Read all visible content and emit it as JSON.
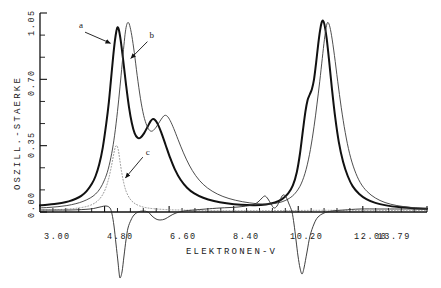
{
  "chart_data": {
    "type": "line",
    "title": "",
    "xlabel": "ELEKTRONEN-V",
    "ylabel": "OSZILL.-STAERKE",
    "xlim": [
      3.0,
      13.79
    ],
    "ylim": [
      0.0,
      1.05
    ],
    "grid": false,
    "legend_position": "inline-annotations",
    "xticklabels": [
      "3.00",
      "4.80",
      "6.60",
      "8.40",
      "10.20",
      "12.00",
      "13.79"
    ],
    "xtickvalues": [
      3.0,
      4.8,
      6.6,
      8.4,
      10.2,
      12.0,
      13.79
    ],
    "xminorticks": 5,
    "yticklabels": [
      "0.00",
      "0.35",
      "0.70",
      "1.05"
    ],
    "ytickvalues": [
      0.0,
      0.35,
      0.7,
      1.05
    ],
    "yminorticks": 2,
    "annotations": [
      {
        "label": "a",
        "x": 4.2,
        "y": 0.97,
        "target_x": 5.02,
        "target_y": 0.88
      },
      {
        "label": "b",
        "x": 6.05,
        "y": 0.92,
        "target_x": 5.42,
        "target_y": 0.8
      },
      {
        "label": "c",
        "x": 5.95,
        "y": 0.3,
        "target_x": 5.3,
        "target_y": 0.17
      }
    ],
    "series": [
      {
        "name": "a",
        "style": "thick-solid",
        "color": "#111111",
        "width": 2.0,
        "description": "main absorption spectrum, thick black curve",
        "points": [
          [
            3.0,
            0.035
          ],
          [
            3.2,
            0.038
          ],
          [
            3.4,
            0.042
          ],
          [
            3.6,
            0.048
          ],
          [
            3.8,
            0.056
          ],
          [
            4.0,
            0.07
          ],
          [
            4.15,
            0.085
          ],
          [
            4.3,
            0.11
          ],
          [
            4.45,
            0.15
          ],
          [
            4.55,
            0.19
          ],
          [
            4.65,
            0.25
          ],
          [
            4.75,
            0.34
          ],
          [
            4.85,
            0.47
          ],
          [
            4.92,
            0.58
          ],
          [
            4.98,
            0.7
          ],
          [
            5.04,
            0.82
          ],
          [
            5.09,
            0.905
          ],
          [
            5.13,
            0.955
          ],
          [
            5.16,
            0.975
          ],
          [
            5.2,
            0.96
          ],
          [
            5.25,
            0.905
          ],
          [
            5.32,
            0.8
          ],
          [
            5.4,
            0.67
          ],
          [
            5.48,
            0.555
          ],
          [
            5.56,
            0.47
          ],
          [
            5.64,
            0.415
          ],
          [
            5.72,
            0.392
          ],
          [
            5.8,
            0.392
          ],
          [
            5.9,
            0.415
          ],
          [
            6.0,
            0.45
          ],
          [
            6.08,
            0.478
          ],
          [
            6.14,
            0.49
          ],
          [
            6.2,
            0.487
          ],
          [
            6.28,
            0.465
          ],
          [
            6.38,
            0.42
          ],
          [
            6.5,
            0.355
          ],
          [
            6.62,
            0.29
          ],
          [
            6.76,
            0.225
          ],
          [
            6.92,
            0.17
          ],
          [
            7.1,
            0.128
          ],
          [
            7.3,
            0.098
          ],
          [
            7.55,
            0.075
          ],
          [
            7.85,
            0.058
          ],
          [
            8.2,
            0.046
          ],
          [
            8.6,
            0.038
          ],
          [
            9.0,
            0.036
          ],
          [
            9.3,
            0.04
          ],
          [
            9.55,
            0.05
          ],
          [
            9.75,
            0.068
          ],
          [
            9.92,
            0.098
          ],
          [
            10.05,
            0.14
          ],
          [
            10.16,
            0.21
          ],
          [
            10.25,
            0.31
          ],
          [
            10.33,
            0.43
          ],
          [
            10.4,
            0.53
          ],
          [
            10.46,
            0.59
          ],
          [
            10.52,
            0.62
          ],
          [
            10.58,
            0.648
          ],
          [
            10.64,
            0.7
          ],
          [
            10.7,
            0.79
          ],
          [
            10.76,
            0.89
          ],
          [
            10.81,
            0.96
          ],
          [
            10.85,
            0.998
          ],
          [
            10.89,
            1.01
          ],
          [
            10.93,
            0.99
          ],
          [
            10.99,
            0.92
          ],
          [
            11.06,
            0.8
          ],
          [
            11.14,
            0.65
          ],
          [
            11.23,
            0.5
          ],
          [
            11.33,
            0.37
          ],
          [
            11.45,
            0.265
          ],
          [
            11.58,
            0.19
          ],
          [
            11.72,
            0.135
          ],
          [
            11.9,
            0.095
          ],
          [
            12.1,
            0.068
          ],
          [
            12.35,
            0.048
          ],
          [
            12.65,
            0.035
          ],
          [
            13.0,
            0.026
          ],
          [
            13.4,
            0.02
          ],
          [
            13.79,
            0.017
          ]
        ]
      },
      {
        "name": "b",
        "style": "thin-solid",
        "color": "#3a3a3a",
        "width": 0.9,
        "description": "comparison spectrum, thin curve shifted slightly to higher energy",
        "points": [
          [
            3.0,
            0.022
          ],
          [
            3.25,
            0.024
          ],
          [
            3.5,
            0.028
          ],
          [
            3.75,
            0.034
          ],
          [
            4.0,
            0.044
          ],
          [
            4.2,
            0.056
          ],
          [
            4.4,
            0.074
          ],
          [
            4.55,
            0.095
          ],
          [
            4.68,
            0.125
          ],
          [
            4.8,
            0.17
          ],
          [
            4.9,
            0.225
          ],
          [
            5.0,
            0.31
          ],
          [
            5.08,
            0.405
          ],
          [
            5.16,
            0.53
          ],
          [
            5.23,
            0.66
          ],
          [
            5.29,
            0.78
          ],
          [
            5.34,
            0.88
          ],
          [
            5.38,
            0.95
          ],
          [
            5.42,
            0.99
          ],
          [
            5.46,
            1.0
          ],
          [
            5.5,
            0.985
          ],
          [
            5.56,
            0.93
          ],
          [
            5.63,
            0.84
          ],
          [
            5.71,
            0.72
          ],
          [
            5.8,
            0.6
          ],
          [
            5.89,
            0.51
          ],
          [
            5.98,
            0.455
          ],
          [
            6.06,
            0.43
          ],
          [
            6.14,
            0.428
          ],
          [
            6.24,
            0.448
          ],
          [
            6.34,
            0.478
          ],
          [
            6.42,
            0.5
          ],
          [
            6.48,
            0.51
          ],
          [
            6.55,
            0.505
          ],
          [
            6.63,
            0.482
          ],
          [
            6.73,
            0.44
          ],
          [
            6.85,
            0.382
          ],
          [
            7.0,
            0.312
          ],
          [
            7.16,
            0.248
          ],
          [
            7.34,
            0.192
          ],
          [
            7.55,
            0.146
          ],
          [
            7.8,
            0.11
          ],
          [
            8.1,
            0.082
          ],
          [
            8.45,
            0.062
          ],
          [
            8.85,
            0.048
          ],
          [
            9.2,
            0.042
          ],
          [
            9.5,
            0.044
          ],
          [
            9.75,
            0.054
          ],
          [
            9.95,
            0.072
          ],
          [
            10.12,
            0.1
          ],
          [
            10.28,
            0.148
          ],
          [
            10.42,
            0.225
          ],
          [
            10.54,
            0.33
          ],
          [
            10.64,
            0.45
          ],
          [
            10.72,
            0.565
          ],
          [
            10.8,
            0.69
          ],
          [
            10.87,
            0.81
          ],
          [
            10.93,
            0.91
          ],
          [
            10.98,
            0.975
          ],
          [
            11.02,
            1.0
          ],
          [
            11.07,
            0.985
          ],
          [
            11.13,
            0.93
          ],
          [
            11.21,
            0.825
          ],
          [
            11.3,
            0.69
          ],
          [
            11.4,
            0.55
          ],
          [
            11.51,
            0.42
          ],
          [
            11.63,
            0.31
          ],
          [
            11.77,
            0.222
          ],
          [
            11.93,
            0.155
          ],
          [
            12.12,
            0.108
          ],
          [
            12.35,
            0.074
          ],
          [
            12.62,
            0.05
          ],
          [
            12.95,
            0.034
          ],
          [
            13.35,
            0.024
          ],
          [
            13.79,
            0.019
          ]
        ]
      },
      {
        "name": "c",
        "style": "dotted",
        "color": "#8a8a8a",
        "width": 0.9,
        "description": "dotted difference/derivative curve; small positive band near 5.1 eV, falling to baseline",
        "points": [
          [
            3.0,
            0.01
          ],
          [
            3.4,
            0.012
          ],
          [
            3.8,
            0.016
          ],
          [
            4.1,
            0.022
          ],
          [
            4.35,
            0.032
          ],
          [
            4.55,
            0.05
          ],
          [
            4.7,
            0.078
          ],
          [
            4.82,
            0.12
          ],
          [
            4.92,
            0.18
          ],
          [
            5.0,
            0.25
          ],
          [
            5.06,
            0.31
          ],
          [
            5.1,
            0.342
          ],
          [
            5.14,
            0.35
          ],
          [
            5.18,
            0.33
          ],
          [
            5.22,
            0.282
          ],
          [
            5.27,
            0.218
          ],
          [
            5.33,
            0.158
          ],
          [
            5.4,
            0.11
          ],
          [
            5.5,
            0.072
          ],
          [
            5.62,
            0.048
          ],
          [
            5.78,
            0.032
          ],
          [
            5.98,
            0.022
          ],
          [
            6.25,
            0.016
          ],
          [
            6.6,
            0.012
          ],
          [
            7.0,
            0.01
          ],
          [
            7.6,
            0.008
          ],
          [
            8.4,
            0.007
          ],
          [
            9.4,
            0.007
          ],
          [
            10.2,
            0.008
          ],
          [
            11.0,
            0.009
          ],
          [
            12.0,
            0.008
          ],
          [
            13.0,
            0.007
          ],
          [
            13.79,
            0.007
          ]
        ]
      },
      {
        "name": "d-below-axis",
        "style": "thin-solid-below",
        "color": "#2a2a2a",
        "width": 0.9,
        "description": "dispersion-like curve plotted below the baseline axis with sharp negative excursions at 5.1 eV and 10.9 eV",
        "baseline_offset_px": 212,
        "points_px": [
          [
            40,
            210
          ],
          [
            70,
            210
          ],
          [
            90,
            209
          ],
          [
            100,
            207
          ],
          [
            106,
            206
          ],
          [
            110,
            208
          ],
          [
            112,
            214
          ],
          [
            114,
            226
          ],
          [
            116,
            244
          ],
          [
            118,
            262
          ],
          [
            119,
            272
          ],
          [
            120,
            278
          ],
          [
            122,
            272
          ],
          [
            124,
            256
          ],
          [
            126,
            240
          ],
          [
            128,
            228
          ],
          [
            131,
            220
          ],
          [
            134,
            215
          ],
          [
            138,
            212
          ],
          [
            143,
            211
          ],
          [
            148,
            212
          ],
          [
            152,
            216
          ],
          [
            156,
            219
          ],
          [
            160,
            220
          ],
          [
            165,
            219
          ],
          [
            170,
            216
          ],
          [
            176,
            213
          ],
          [
            184,
            211
          ],
          [
            194,
            210
          ],
          [
            206,
            209
          ],
          [
            220,
            208
          ],
          [
            238,
            207
          ],
          [
            252,
            205
          ],
          [
            258,
            202
          ],
          [
            262,
            198
          ],
          [
            265,
            196
          ],
          [
            268,
            199
          ],
          [
            271,
            204
          ],
          [
            274,
            208
          ],
          [
            277,
            206
          ],
          [
            280,
            200
          ],
          [
            283,
            195
          ],
          [
            286,
            197
          ],
          [
            289,
            204
          ],
          [
            292,
            212
          ],
          [
            294,
            224
          ],
          [
            296,
            240
          ],
          [
            298,
            256
          ],
          [
            300,
            268
          ],
          [
            302,
            274
          ],
          [
            304,
            268
          ],
          [
            307,
            252
          ],
          [
            310,
            236
          ],
          [
            314,
            224
          ],
          [
            318,
            217
          ],
          [
            324,
            213
          ],
          [
            332,
            211
          ],
          [
            344,
            210
          ],
          [
            360,
            209
          ],
          [
            380,
            209
          ],
          [
            400,
            209
          ],
          [
            425,
            209
          ]
        ]
      }
    ]
  },
  "axes": {
    "y_axis_label": "OSZILL.-STAERKE",
    "x_axis_label": "ELEKTRONEN-V",
    "y_tick_0": "0.00",
    "y_tick_1": "0.35",
    "y_tick_2": "0.70",
    "y_tick_3": "1.05",
    "x_tick_0": "3.00",
    "x_tick_1": "4.80",
    "x_tick_2": "6.60",
    "x_tick_3": "8.40",
    "x_tick_4": "10.20",
    "x_tick_5": "12.00",
    "x_tick_6": "13.79"
  },
  "curve_labels": {
    "a": "a",
    "b": "b",
    "c": "c"
  },
  "colors": {
    "ink": "#111111",
    "thin_ink": "#3a3a3a",
    "dotted_ink": "#8a8a8a",
    "background": "#ffffff"
  }
}
